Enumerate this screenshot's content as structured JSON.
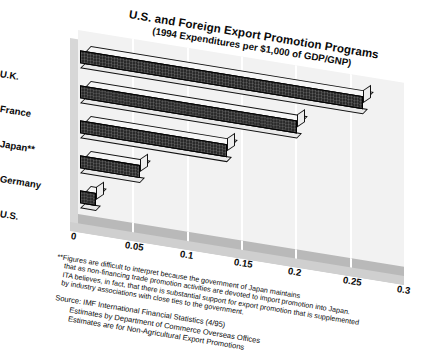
{
  "chart_data": {
    "type": "bar",
    "orientation": "horizontal",
    "title": "U.S. and Foreign Export Promotion Programs",
    "subtitle": "(1994 Expenditures per $1,000 of GDP/GNP)",
    "categories": [
      "U.K.",
      "France",
      "Japan**",
      "Germany",
      "U.S."
    ],
    "values": [
      0.26,
      0.2,
      0.135,
      0.055,
      0.015
    ],
    "series": [
      {
        "name": "1994 Expenditures per $1,000 of GDP/GNP",
        "values": [
          0.26,
          0.2,
          0.135,
          0.055,
          0.015
        ]
      }
    ],
    "xlabel": "",
    "ylabel": "",
    "xlim": [
      0,
      0.3
    ],
    "xticks": [
      "0",
      "0.05",
      "0.1",
      "0.15",
      "0.2",
      "0.25",
      "0.3"
    ],
    "xtick_values": [
      0,
      0.05,
      0.1,
      0.15,
      0.2,
      0.25,
      0.3
    ],
    "grid": true,
    "legend": false,
    "style": "3d-ribbon-bars",
    "bar_color": "#2a2a2a",
    "plot_background": "#f2f2f2",
    "floor_color": "#b9b9b9"
  },
  "footnote": {
    "marker": "**",
    "lines": [
      "**Figures are difficult to interpret because the government of Japan maintains",
      "that as non-financing trade promotion activities are devoted to import promotion into Japan.",
      "ITA believes, in fact, that there is substantial support for export promotion that is supplemented",
      "by industry associations with close ties to the government."
    ]
  },
  "source": {
    "lines": [
      "Source: IMF International Financial Statistics (4/95)",
      "Estimates by Department of Commerce Overseas Offices",
      "Estimates are for Non-Agricultural Export Promotions"
    ]
  }
}
